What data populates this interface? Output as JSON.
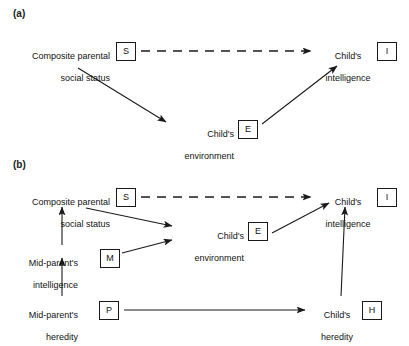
{
  "figure": {
    "panels": [
      {
        "id": "a",
        "label": "(a)",
        "nodes": [
          {
            "name": "composite-parental-social-status",
            "line1": "Composite parental",
            "line2": "social status",
            "box": "S"
          },
          {
            "name": "childs-environment",
            "line1": "Child's",
            "line2": "environment",
            "box": "E"
          },
          {
            "name": "childs-intelligence",
            "line1": "Child's",
            "line2": "intelligence",
            "box": "I"
          }
        ],
        "edges": [
          {
            "from": "S",
            "to": "I",
            "style": "dashed"
          },
          {
            "from": "S",
            "to": "E",
            "style": "solid"
          },
          {
            "from": "E",
            "to": "I",
            "style": "solid"
          }
        ]
      },
      {
        "id": "b",
        "label": "(b)",
        "nodes": [
          {
            "name": "composite-parental-social-status",
            "line1": "Composite parental",
            "line2": "social status",
            "box": "S"
          },
          {
            "name": "mid-parents-intelligence",
            "line1": "Mid-parent's",
            "line2": "intelligence",
            "box": "M"
          },
          {
            "name": "mid-parents-heredity",
            "line1": "Mid-parent's",
            "line2": "heredity",
            "box": "P"
          },
          {
            "name": "childs-environment",
            "line1": "Child's",
            "line2": "environment",
            "box": "E"
          },
          {
            "name": "childs-heredity",
            "line1": "Child's",
            "line2": "heredity",
            "box": "H"
          },
          {
            "name": "childs-intelligence",
            "line1": "Child's",
            "line2": "intelligence",
            "box": "I"
          }
        ],
        "edges": [
          {
            "from": "S",
            "to": "I",
            "style": "dashed"
          },
          {
            "from": "S",
            "to": "E",
            "style": "solid"
          },
          {
            "from": "M",
            "to": "E",
            "style": "solid"
          },
          {
            "from": "M",
            "to": "S",
            "style": "solid"
          },
          {
            "from": "P",
            "to": "M",
            "style": "solid"
          },
          {
            "from": "P",
            "to": "H",
            "style": "solid"
          },
          {
            "from": "E",
            "to": "I",
            "style": "solid"
          },
          {
            "from": "H",
            "to": "I",
            "style": "solid"
          }
        ]
      }
    ],
    "colors": {
      "ink": "#1a1a1a",
      "background": "#ffffff"
    }
  }
}
